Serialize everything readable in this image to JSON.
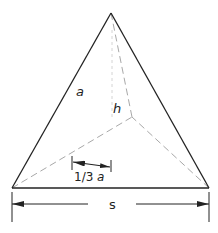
{
  "diagram": {
    "colors": {
      "edge": "#222222",
      "hidden": "#a8a8a8",
      "dimension": "#222222",
      "background": "#ffffff"
    },
    "labels": {
      "edge": "a",
      "height": "h",
      "third": "1/3",
      "third_var": "a",
      "side": "s"
    },
    "vertices": {
      "apex": [
        111,
        13
      ],
      "left": [
        12,
        188
      ],
      "right": [
        209,
        188
      ],
      "centroid": [
        132,
        117
      ]
    }
  }
}
